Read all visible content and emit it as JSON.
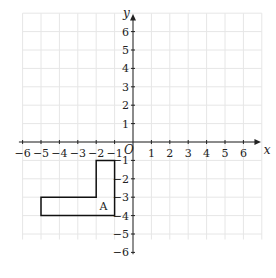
{
  "axes": {
    "x_label": "x",
    "y_label": "y",
    "origin_label": "O",
    "x_ticks": [
      -6,
      -5,
      -4,
      -3,
      -2,
      -1,
      1,
      2,
      3,
      4,
      5,
      6
    ],
    "y_ticks": [
      6,
      5,
      4,
      3,
      2,
      1,
      -1,
      -2,
      -3,
      -4,
      -5,
      -6
    ]
  },
  "shape": {
    "label": "A",
    "vertices": [
      [
        -2,
        -1
      ],
      [
        -1,
        -1
      ],
      [
        -1,
        -4
      ],
      [
        -5,
        -4
      ],
      [
        -5,
        -3
      ],
      [
        -2,
        -3
      ]
    ]
  },
  "colors": {
    "grid": "#e6e6e6",
    "axis": "#222222",
    "shape": "#111111"
  }
}
